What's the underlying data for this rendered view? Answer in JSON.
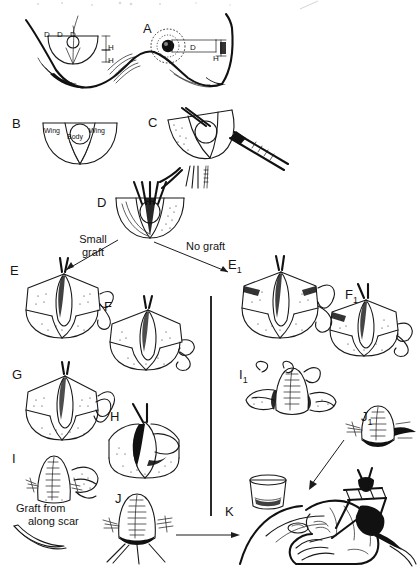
{
  "figure": {
    "type": "surgical-technique-diagram",
    "width": 418,
    "height": 573,
    "background_color": "#ffffff",
    "ink_color": "#1a1a1a"
  },
  "panels": [
    {
      "id": "A",
      "label": "A",
      "label_x": 143,
      "label_y": 22,
      "description": "Frontal view of both breasts; left breast shows planned skate-flap markings with dimensions, right breast shows projected nipple with dimension callouts"
    },
    {
      "id": "B",
      "label": "B",
      "label_x": 12,
      "label_y": 117,
      "description": "Flap design template with labelled wings and central body"
    },
    {
      "id": "C",
      "label": "C",
      "label_x": 148,
      "label_y": 116,
      "description": "Flap elevation with forceps and scalpel"
    },
    {
      "id": "D",
      "label": "D",
      "label_x": 97,
      "label_y": 196,
      "description": "Elevated skate flap held with multiple sutures; branch point of technique"
    },
    {
      "id": "E",
      "label": "E",
      "label_x": 10,
      "label_y": 264,
      "description": "Small graft branch: flap with wings spread, suture tails"
    },
    {
      "id": "F",
      "label": "F",
      "label_x": 104,
      "label_y": 300,
      "description": "Small graft branch: wings wrapped around body"
    },
    {
      "id": "G",
      "label": "G",
      "label_x": 12,
      "label_y": 368,
      "description": "Small graft branch: wings approximated, body tube forming"
    },
    {
      "id": "H",
      "label": "H",
      "label_x": 110,
      "label_y": 410,
      "description": "Small graft branch: closure of donor site around new nipple"
    },
    {
      "id": "I",
      "label": "I",
      "label_x": 12,
      "label_y": 452,
      "description": "Small graft branch: sutured nipple with graft taken from along the scar"
    },
    {
      "id": "J",
      "label": "J",
      "label_x": 115,
      "label_y": 492,
      "description": "Small graft branch: completed sutured nipple reconstruction"
    },
    {
      "id": "E1",
      "label": "E",
      "sub": "1",
      "label_x": 228,
      "label_y": 258,
      "description": "No graft branch: flap with wings spread, suture tails"
    },
    {
      "id": "F1",
      "label": "F",
      "sub": "1",
      "label_x": 345,
      "label_y": 288,
      "description": "No graft branch: wings wrapped around body"
    },
    {
      "id": "I1",
      "label": "I",
      "sub": "1",
      "label_x": 239,
      "label_y": 368,
      "description": "No graft branch: sutured nipple with wings folded"
    },
    {
      "id": "J1",
      "label": "J",
      "sub": "1",
      "label_x": 361,
      "label_y": 410,
      "description": "No graft branch: completed sutured nipple reconstruction"
    },
    {
      "id": "K",
      "label": "K",
      "label_x": 225,
      "label_y": 505,
      "description": "Intradermal tattooing of the areola using a tattoo device and pigment cup, operator hand supporting the breast"
    }
  ],
  "flow": {
    "branch_left_label": "Small graft",
    "branch_right_label": "No graft",
    "divider": {
      "x": 210,
      "y_top": 296,
      "y_bottom": 516
    }
  },
  "captions": {
    "graft_from_scar_line1": "Graft from",
    "graft_from_scar_line2": "along scar"
  },
  "panel_b_labels": {
    "wing_left": "Wing",
    "body": "Body",
    "wing_right": "Wing"
  },
  "panel_a_labels": {
    "diameter_left_1": "D",
    "diameter_left_2": "D",
    "diameter_left_3": "D",
    "height_left_1": "H",
    "height_left_2": "H",
    "diameter_right": "D",
    "height_right": "H"
  }
}
